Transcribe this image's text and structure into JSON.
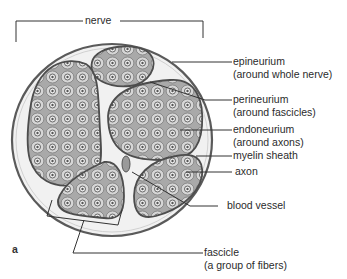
{
  "figure": {
    "panel_letter": "a",
    "title_label": "nerve",
    "labels": [
      {
        "id": "epineurium",
        "line1": "epineurium",
        "line2": "(around whole nerve)"
      },
      {
        "id": "perineurium",
        "line1": "perineurium",
        "line2": "(around fascicles)"
      },
      {
        "id": "endoneurium",
        "line1": "endoneurium",
        "line2": "(around axons)"
      },
      {
        "id": "myelin",
        "line1": "myelin sheath"
      },
      {
        "id": "axon",
        "line1": "axon"
      },
      {
        "id": "blood-vessel",
        "line1": "blood vessel"
      },
      {
        "id": "fascicle",
        "line1": "fascicle",
        "line2": "(a group of fibers)"
      }
    ],
    "colors": {
      "outline": "#555555",
      "fascicle_fill": "#bdbdbd",
      "cell_fill": "#d9d9d9",
      "epineurium_fill": "#f2f2f2",
      "line": "#333333"
    }
  }
}
